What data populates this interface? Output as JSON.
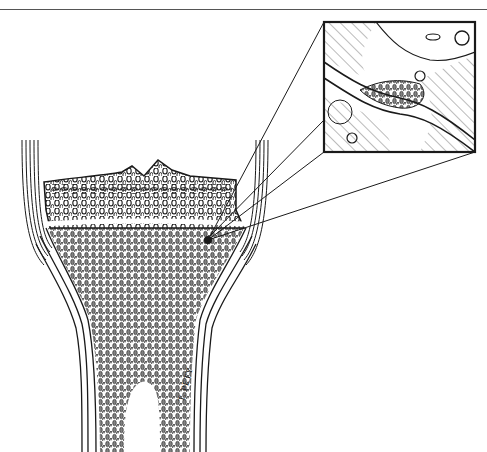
{
  "figure": {
    "signature": "T. PETY",
    "colors": {
      "ink": "#1a1a1a",
      "paper": "#ffffff",
      "rule": "#555555"
    }
  },
  "inset": {
    "label": "magnified-inset",
    "box": {
      "x": 324,
      "y": 22,
      "w": 151,
      "h": 130
    }
  },
  "bone": {
    "cap_top_y": 170,
    "growth_line_y": 220,
    "shaft_bottom_y": 452
  }
}
